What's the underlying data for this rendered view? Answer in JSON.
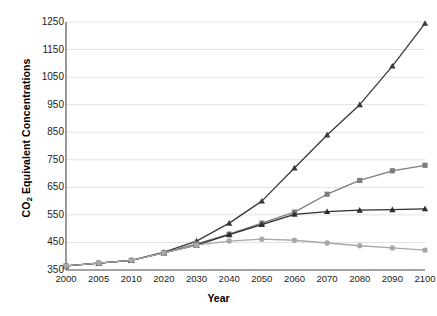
{
  "chart_data": {
    "type": "line",
    "title": "",
    "xlabel": "Year",
    "ylabel_prefix": "CO",
    "ylabel_sub": "2",
    "ylabel_suffix": " Equivalent Concentrations",
    "ylabel_full": "CO2 Equivalent Concentrations",
    "categories": [
      "2000",
      "2005",
      "2010",
      "2020",
      "2030",
      "2040",
      "2050",
      "2060",
      "2070",
      "2080",
      "2090",
      "2100"
    ],
    "x": [
      2000,
      2005,
      2010,
      2020,
      2030,
      2040,
      2050,
      2060,
      2070,
      2080,
      2090,
      2100
    ],
    "ylim": [
      350,
      1250
    ],
    "ytick_values": [
      350,
      450,
      550,
      650,
      750,
      850,
      950,
      1050,
      1150,
      1250
    ],
    "ytick_labels": [
      "350",
      "450",
      "550",
      "650",
      "750",
      "850",
      "950",
      "1050",
      "1150",
      "1250"
    ],
    "grid": "horizontal",
    "legend": "none",
    "series": [
      {
        "name": "high-growth-scenario",
        "marker": "triangle",
        "color": "#3a3a3a",
        "values": [
          365,
          375,
          385,
          415,
          455,
          520,
          600,
          720,
          840,
          950,
          1090,
          1245
        ]
      },
      {
        "name": "mid-growth-scenario",
        "marker": "square",
        "color": "#7d7d7d",
        "values": [
          365,
          375,
          385,
          413,
          445,
          480,
          520,
          560,
          625,
          675,
          710,
          730
        ]
      },
      {
        "name": "stabilization-scenario",
        "marker": "triangle",
        "color": "#2d2d2d",
        "values": [
          365,
          375,
          385,
          412,
          440,
          478,
          515,
          552,
          562,
          567,
          569,
          572
        ]
      },
      {
        "name": "mitigation-scenario",
        "marker": "circle",
        "color": "#a8a8a8",
        "values": [
          365,
          375,
          385,
          412,
          440,
          455,
          462,
          458,
          448,
          438,
          430,
          422
        ]
      }
    ]
  },
  "colors": {
    "axis": "#555555",
    "grid": "#e2e2e2",
    "background": "#ffffff",
    "text": "#222222"
  }
}
